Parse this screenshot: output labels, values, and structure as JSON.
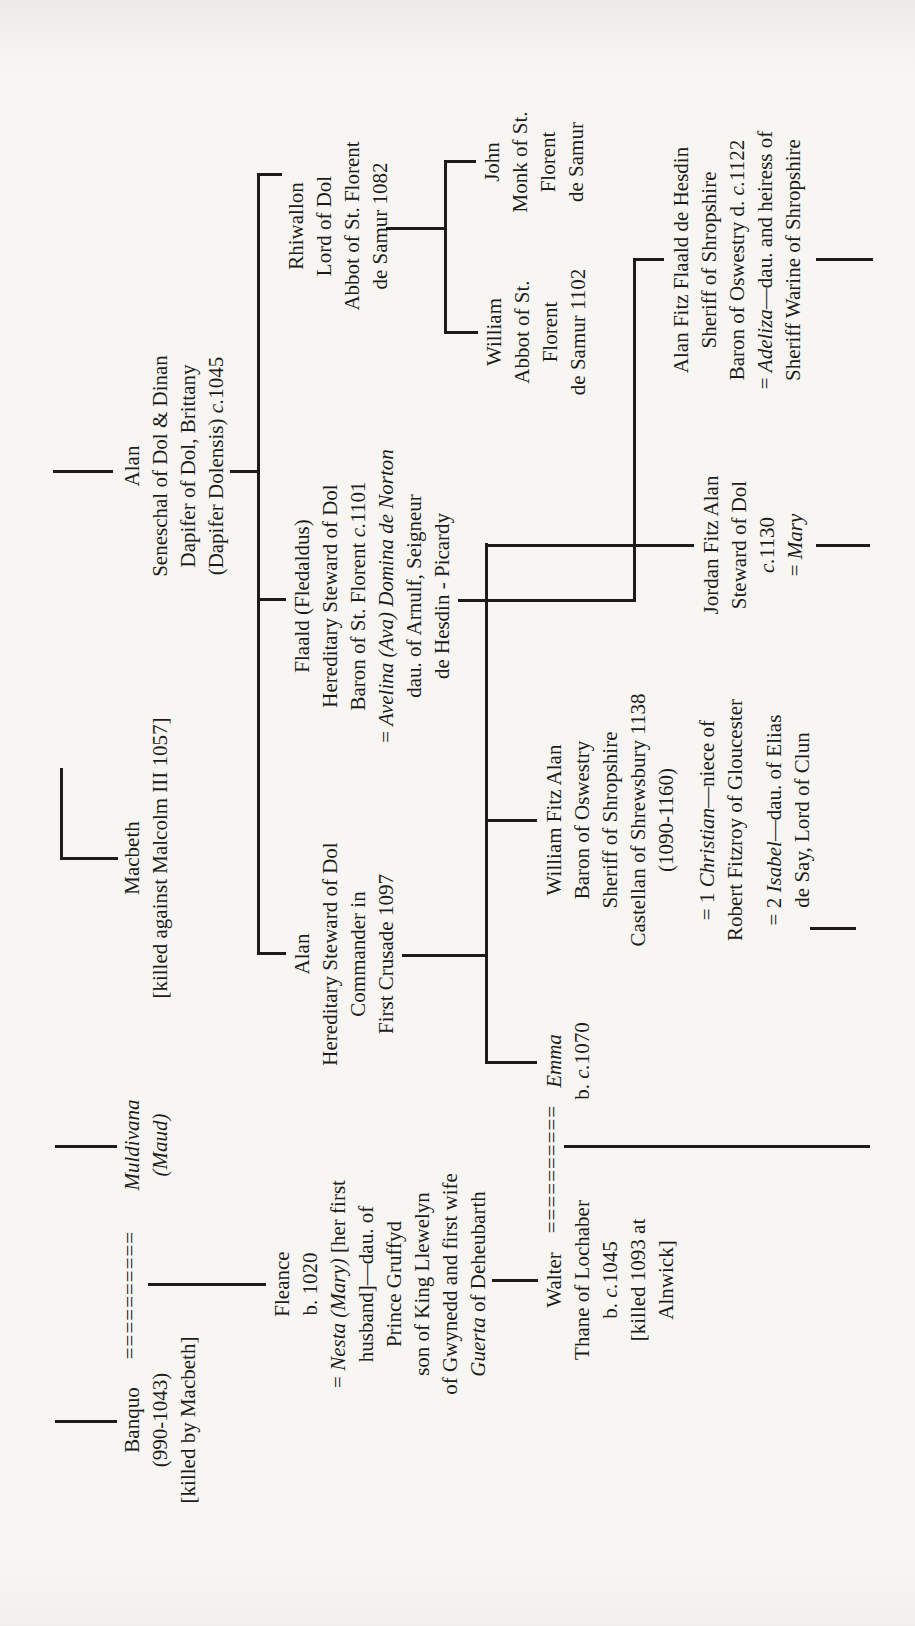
{
  "page": {
    "background": "#f7f6f2",
    "ink_color": "#1d1c1a",
    "description_title": "",
    "chart_type": "genealogical-tree-rotated-90"
  },
  "tree": {
    "people": [
      {
        "id": "banquo",
        "cx": 206,
        "top": 118,
        "lines": [
          {
            "segs": [
              [
                "Banquo",
                false
              ]
            ]
          },
          {
            "segs": [
              [
                "(990-1043)",
                false
              ]
            ]
          },
          {
            "segs": [
              [
                "[killed by Macbeth]",
                false
              ]
            ]
          }
        ]
      },
      {
        "id": "marriage-banquo-muldivana",
        "cx": 331,
        "top": 116,
        "marriage": true,
        "lines": [
          {
            "segs": [
              [
                "==========",
                false
              ]
            ]
          }
        ]
      },
      {
        "id": "muldivana",
        "cx": 481,
        "top": 118,
        "lines": [
          {
            "segs": [
              [
                "Muldivana",
                true
              ]
            ]
          },
          {
            "segs": [
              [
                "(Maud)",
                true
              ]
            ]
          }
        ]
      },
      {
        "id": "macbeth",
        "cx": 768,
        "top": 118,
        "lines": [
          {
            "segs": [
              [
                "Macbeth",
                false
              ]
            ]
          },
          {
            "segs": [
              [
                "[killed against Malcolm III 1057]",
                false
              ]
            ]
          }
        ]
      },
      {
        "id": "alan-seneschal",
        "cx": 1160,
        "top": 118,
        "lines": [
          {
            "segs": [
              [
                "Alan",
                false
              ]
            ]
          },
          {
            "segs": [
              [
                "Seneschal of Dol & Dinan",
                false
              ]
            ]
          },
          {
            "segs": [
              [
                "Dapifer of Dol, Brittany",
                false
              ]
            ]
          },
          {
            "segs": [
              [
                "(Dapifer Dolensis) ",
                false
              ],
              [
                "c.",
                true
              ],
              [
                "1045",
                false
              ]
            ]
          }
        ]
      },
      {
        "id": "fleance",
        "cx": 342,
        "top": 268,
        "lines": [
          {
            "segs": [
              [
                "Fleance",
                false
              ]
            ]
          },
          {
            "segs": [
              [
                "b. 1020",
                false
              ]
            ]
          },
          {
            "segs": [
              [
                "= ",
                false
              ],
              [
                "Nesta (Mary)",
                true
              ],
              [
                " [her first",
                false
              ]
            ]
          },
          {
            "segs": [
              [
                "husband]—dau. of",
                false
              ]
            ]
          },
          {
            "segs": [
              [
                "Prince Gruffyd",
                false
              ]
            ]
          },
          {
            "segs": [
              [
                "son of King Llewelyn",
                false
              ]
            ]
          },
          {
            "segs": [
              [
                "of Gwynedd and first wife",
                false
              ]
            ]
          },
          {
            "segs": [
              [
                "Guerta",
                true
              ],
              [
                " of Deheubarth",
                false
              ]
            ]
          }
        ]
      },
      {
        "id": "alan-crusader",
        "cx": 672,
        "top": 288,
        "lines": [
          {
            "segs": [
              [
                "Alan",
                false
              ]
            ]
          },
          {
            "segs": [
              [
                "Hereditary Steward of Dol",
                false
              ]
            ]
          },
          {
            "segs": [
              [
                "Commander in",
                false
              ]
            ]
          },
          {
            "segs": [
              [
                "First Crusade 1097",
                false
              ]
            ]
          }
        ]
      },
      {
        "id": "flaald",
        "cx": 1030,
        "top": 288,
        "lines": [
          {
            "segs": [
              [
                "Flaald (Fledaldus)",
                false
              ]
            ]
          },
          {
            "segs": [
              [
                "Hereditary Steward of Dol",
                false
              ]
            ]
          },
          {
            "segs": [
              [
                "Baron of St. Florent ",
                false
              ],
              [
                "c.",
                true
              ],
              [
                "1101",
                false
              ]
            ]
          },
          {
            "segs": [
              [
                "= ",
                false
              ],
              [
                "Avelina (Ava) Domina de Norton",
                true
              ]
            ]
          },
          {
            "segs": [
              [
                "dau. of Arnulf, Seigneur",
                false
              ]
            ]
          },
          {
            "segs": [
              [
                "de Hesdin - Picardy",
                false
              ]
            ]
          }
        ]
      },
      {
        "id": "rhiwallon",
        "cx": 1400,
        "top": 282,
        "lines": [
          {
            "segs": [
              [
                "Rhiwallon",
                false
              ]
            ]
          },
          {
            "segs": [
              [
                "Lord of Dol",
                false
              ]
            ]
          },
          {
            "segs": [
              [
                "Abbot of St. Florent",
                false
              ]
            ]
          },
          {
            "segs": [
              [
                "de Samur 1082",
                false
              ]
            ]
          }
        ]
      },
      {
        "id": "william-abbot",
        "cx": 1294,
        "top": 480,
        "lines": [
          {
            "segs": [
              [
                "William",
                false
              ]
            ]
          },
          {
            "segs": [
              [
                "Abbot of St.",
                false
              ]
            ]
          },
          {
            "segs": [
              [
                "Florent",
                false
              ]
            ]
          },
          {
            "segs": [
              [
                "de Samur 1102",
                false
              ]
            ]
          }
        ]
      },
      {
        "id": "john-monk",
        "cx": 1464,
        "top": 478,
        "lines": [
          {
            "segs": [
              [
                "John",
                false
              ]
            ]
          },
          {
            "segs": [
              [
                "Monk of St.",
                false
              ]
            ]
          },
          {
            "segs": [
              [
                "Florent",
                false
              ]
            ]
          },
          {
            "segs": [
              [
                "de Samur",
                false
              ]
            ]
          }
        ]
      },
      {
        "id": "walter",
        "cx": 346,
        "top": 540,
        "lines": [
          {
            "segs": [
              [
                "Walter",
                false
              ]
            ]
          },
          {
            "segs": [
              [
                "Thane of Lochaber",
                false
              ]
            ]
          },
          {
            "segs": [
              [
                "b. ",
                false
              ],
              [
                "c.",
                true
              ],
              [
                "1045",
                false
              ]
            ]
          },
          {
            "segs": [
              [
                "[killed 1093 at",
                false
              ]
            ]
          },
          {
            "segs": [
              [
                "Alnwick]",
                false
              ]
            ]
          }
        ]
      },
      {
        "id": "marriage-walter-emma",
        "cx": 457,
        "top": 538,
        "marriage": true,
        "lines": [
          {
            "segs": [
              [
                "==========",
                false
              ]
            ]
          }
        ]
      },
      {
        "id": "emma",
        "cx": 565,
        "top": 540,
        "lines": [
          {
            "segs": [
              [
                "Emma",
                true
              ]
            ]
          },
          {
            "segs": [
              [
                "b. ",
                false
              ],
              [
                "c.",
                true
              ],
              [
                "1070",
                false
              ]
            ]
          }
        ]
      },
      {
        "id": "william-fitz-alan",
        "cx": 806,
        "top": 540,
        "lines": [
          {
            "segs": [
              [
                "William Fitz Alan",
                false
              ]
            ]
          },
          {
            "segs": [
              [
                "Baron of Oswestry",
                false
              ]
            ]
          },
          {
            "segs": [
              [
                "Sheriff of Shropshire",
                false
              ]
            ]
          },
          {
            "segs": [
              [
                "Castellan of Shrewsbury 1138",
                false
              ]
            ]
          },
          {
            "segs": [
              [
                "(1090-1160)",
                false
              ]
            ]
          },
          {
            "segs": [
              [
                "= 1 ",
                false
              ],
              [
                "Christian",
                true
              ],
              [
                "—niece of",
                false
              ]
            ],
            "mt": 13
          },
          {
            "segs": [
              [
                "Robert Fitzroy of Gloucester",
                false
              ]
            ]
          },
          {
            "segs": [
              [
                "= 2 ",
                false
              ],
              [
                "Isabel",
                true
              ],
              [
                "—dau. of Elias",
                false
              ]
            ],
            "mt": 11
          },
          {
            "segs": [
              [
                "de Say, Lord of Clun",
                false
              ]
            ]
          }
        ]
      },
      {
        "id": "jordan-fitz-alan",
        "cx": 1081,
        "top": 697,
        "lines": [
          {
            "segs": [
              [
                "Jordan Fitz Alan",
                false
              ]
            ]
          },
          {
            "segs": [
              [
                "Steward of Dol",
                false
              ]
            ]
          },
          {
            "segs": [
              [
                "c.",
                true
              ],
              [
                "1130",
                false
              ]
            ]
          },
          {
            "segs": [
              [
                "= ",
                false
              ],
              [
                "Mary",
                true
              ]
            ]
          }
        ]
      },
      {
        "id": "alan-fitz-flaald",
        "cx": 1366,
        "top": 667,
        "lines": [
          {
            "segs": [
              [
                "Alan Fitz Flaald de Hesdin",
                false
              ]
            ]
          },
          {
            "segs": [
              [
                "Sheriff of Shropshire",
                false
              ]
            ]
          },
          {
            "segs": [
              [
                "Baron of Oswestry d. ",
                false
              ],
              [
                "c.",
                true
              ],
              [
                "1122",
                false
              ]
            ]
          },
          {
            "segs": [
              [
                "= ",
                false
              ],
              [
                "Adeliza",
                true
              ],
              [
                "—dau. and heiress of",
                false
              ]
            ]
          },
          {
            "segs": [
              [
                "Sheriff Warine of Shropshire",
                false
              ]
            ]
          }
        ]
      }
    ],
    "connectors": [
      {
        "name": "drop-banquo",
        "left": 203,
        "top": 55,
        "width": 3,
        "height": 62
      },
      {
        "name": "drop-muldivana",
        "left": 478,
        "top": 55,
        "width": 3,
        "height": 62
      },
      {
        "name": "rail-macbeth-tail",
        "left": 768,
        "top": 60,
        "width": 90,
        "height": 3
      },
      {
        "name": "drop-macbeth",
        "left": 766,
        "top": 60,
        "width": 3,
        "height": 58
      },
      {
        "name": "drop-alan-seneschal",
        "left": 1153,
        "top": 53,
        "width": 3,
        "height": 60
      },
      {
        "name": "drop-fleance",
        "left": 340,
        "top": 148,
        "width": 3,
        "height": 118
      },
      {
        "name": "rail-gen2",
        "left": 671,
        "top": 257,
        "width": 782,
        "height": 3
      },
      {
        "name": "riser-alan-seneschal",
        "left": 1153,
        "top": 230,
        "width": 3,
        "height": 29
      },
      {
        "name": "drop-alan-crusader",
        "left": 671,
        "top": 257,
        "width": 3,
        "height": 29
      },
      {
        "name": "drop-flaald",
        "left": 1025,
        "top": 257,
        "width": 3,
        "height": 29
      },
      {
        "name": "drop-rhiwallon",
        "left": 1450,
        "top": 257,
        "width": 3,
        "height": 25
      },
      {
        "name": "descent-rhiwallon",
        "left": 1396,
        "top": 386,
        "width": 3,
        "height": 60
      },
      {
        "name": "rail-samur-monks",
        "left": 1292,
        "top": 444,
        "width": 174,
        "height": 3
      },
      {
        "name": "drop-william-abbot",
        "left": 1292,
        "top": 444,
        "width": 3,
        "height": 34
      },
      {
        "name": "drop-john-monk",
        "left": 1463,
        "top": 444,
        "width": 3,
        "height": 32
      },
      {
        "name": "descent-alan-crusader",
        "left": 669,
        "top": 402,
        "width": 3,
        "height": 85
      },
      {
        "name": "rail-gen3",
        "left": 562,
        "top": 485,
        "width": 521,
        "height": 3
      },
      {
        "name": "drop-emma",
        "left": 562,
        "top": 485,
        "width": 3,
        "height": 52
      },
      {
        "name": "drop-william-fitz-alan",
        "left": 804,
        "top": 485,
        "width": 3,
        "height": 52
      },
      {
        "name": "drop-jordan",
        "left": 1079,
        "top": 485,
        "width": 3,
        "height": 209
      },
      {
        "name": "descent-flaald",
        "left": 1024,
        "top": 458,
        "width": 3,
        "height": 178
      },
      {
        "name": "rail-flaald-to-aff",
        "left": 1024,
        "top": 633,
        "width": 344,
        "height": 3
      },
      {
        "name": "drop-alan-fitz-flaald",
        "left": 1365,
        "top": 633,
        "width": 3,
        "height": 31
      },
      {
        "name": "drop-walter",
        "left": 344,
        "top": 492,
        "width": 3,
        "height": 46
      },
      {
        "name": "descent-walter-emma",
        "left": 478,
        "top": 564,
        "width": 3,
        "height": 306
      },
      {
        "name": "descent-william-fitz-alan",
        "left": 696,
        "top": 810,
        "width": 3,
        "height": 46
      },
      {
        "name": "descent-jordan",
        "left": 1079,
        "top": 816,
        "width": 3,
        "height": 54
      },
      {
        "name": "descent-alan-fitz-flaald",
        "left": 1365,
        "top": 816,
        "width": 3,
        "height": 57
      }
    ]
  }
}
